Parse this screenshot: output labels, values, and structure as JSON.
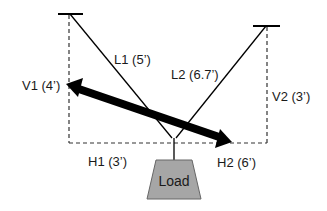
{
  "diagram": {
    "cables": [
      {
        "id": "L1",
        "label": "L1 (5’)",
        "length_ft": 5
      },
      {
        "id": "L2",
        "label": "L2 (6.7’)",
        "length_ft": 6.7
      }
    ],
    "verticals": [
      {
        "id": "V1",
        "label": "V1 (4’)",
        "length_ft": 4
      },
      {
        "id": "V2",
        "label": "V2 (3’)",
        "length_ft": 3
      }
    ],
    "horizontals": [
      {
        "id": "H1",
        "label": "H1 (3’)",
        "length_ft": 3
      },
      {
        "id": "H2",
        "label": "H2 (6’)",
        "length_ft": 6
      }
    ],
    "load": {
      "label": "Load",
      "fill": "#a6a6a6"
    },
    "colors": {
      "line": "#000000",
      "dashed": "#333333",
      "arrow": "#000000"
    }
  }
}
